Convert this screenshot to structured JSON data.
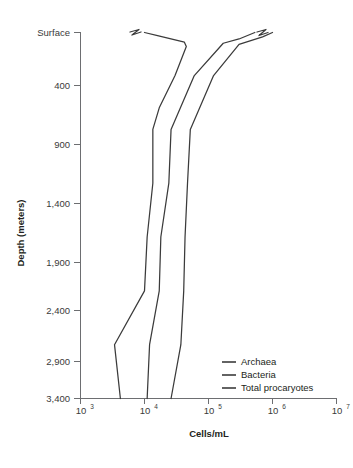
{
  "chart_data": {
    "type": "line",
    "title": "",
    "xlabel": "Cells/mL",
    "ylabel": "Depth (meters)",
    "orientation": "vertical-depth-profile",
    "xscale": "log",
    "xlim": [
      1000,
      10000000
    ],
    "ylim": [
      0,
      3400
    ],
    "y_inverted": true,
    "grid": false,
    "legend_position": "bottom-right",
    "x_tick_labels": [
      "10",
      "10",
      "10",
      "10",
      "10"
    ],
    "x_tick_exponents": [
      "3",
      "4",
      "5",
      "6",
      "7"
    ],
    "x_tick_values": [
      1000,
      10000,
      100000,
      1000000,
      10000000
    ],
    "y_tick_labels": [
      "Surface",
      "400",
      "900",
      "1,400",
      "1,900",
      "2,400",
      "2,900",
      "3,400"
    ],
    "y_tick_values": [
      0,
      400,
      900,
      1400,
      1900,
      2400,
      2900,
      3400
    ],
    "note": "Lines near the surface carry axis-break zigzag marks indicating compressed/interrupted data",
    "series": [
      {
        "name": "Archaea",
        "color": "#3b3b3b",
        "has_break_mark": true,
        "points": [
          {
            "depth": 0,
            "cells_per_ml": 10000
          },
          {
            "depth": 30,
            "cells_per_ml": 16000
          },
          {
            "depth": 90,
            "cells_per_ml": 42000
          },
          {
            "depth": 130,
            "cells_per_ml": 45000
          },
          {
            "depth": 400,
            "cells_per_ml": 30000
          },
          {
            "depth": 700,
            "cells_per_ml": 17000
          },
          {
            "depth": 900,
            "cells_per_ml": 13500
          },
          {
            "depth": 1400,
            "cells_per_ml": 13500
          },
          {
            "depth": 1900,
            "cells_per_ml": 11000
          },
          {
            "depth": 2400,
            "cells_per_ml": 10000
          },
          {
            "depth": 2900,
            "cells_per_ml": 3400
          },
          {
            "depth": 3400,
            "cells_per_ml": 4200
          }
        ]
      },
      {
        "name": "Bacteria",
        "color": "#3b3b3b",
        "has_break_mark": false,
        "points": [
          {
            "depth": 0,
            "cells_per_ml": 530000
          },
          {
            "depth": 60,
            "cells_per_ml": 300000
          },
          {
            "depth": 100,
            "cells_per_ml": 170000
          },
          {
            "depth": 400,
            "cells_per_ml": 60000
          },
          {
            "depth": 900,
            "cells_per_ml": 26000
          },
          {
            "depth": 1400,
            "cells_per_ml": 24000
          },
          {
            "depth": 1900,
            "cells_per_ml": 18000
          },
          {
            "depth": 2400,
            "cells_per_ml": 17000
          },
          {
            "depth": 2900,
            "cells_per_ml": 12000
          },
          {
            "depth": 3400,
            "cells_per_ml": 11000
          }
        ]
      },
      {
        "name": "Total procaryotes",
        "color": "#3b3b3b",
        "has_break_mark": true,
        "points": [
          {
            "depth": 0,
            "cells_per_ml": 1000000
          },
          {
            "depth": 40,
            "cells_per_ml": 700000
          },
          {
            "depth": 110,
            "cells_per_ml": 300000
          },
          {
            "depth": 400,
            "cells_per_ml": 120000
          },
          {
            "depth": 900,
            "cells_per_ml": 52000
          },
          {
            "depth": 1400,
            "cells_per_ml": 47000
          },
          {
            "depth": 1900,
            "cells_per_ml": 43000
          },
          {
            "depth": 2400,
            "cells_per_ml": 41000
          },
          {
            "depth": 2900,
            "cells_per_ml": 37000
          },
          {
            "depth": 3400,
            "cells_per_ml": 26000
          }
        ]
      }
    ]
  },
  "legend": {
    "entries": [
      {
        "label": "Archaea"
      },
      {
        "label": "Bacteria"
      },
      {
        "label": "Total procaryotes"
      }
    ]
  }
}
